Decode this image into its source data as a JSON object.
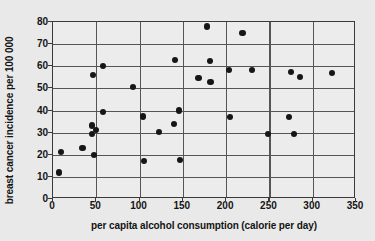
{
  "chart_data": {
    "type": "scatter",
    "title": "",
    "xlabel": "per capita alcohol consumption (calorie per day)",
    "ylabel": "breast cancer incidence per 100 000",
    "xlim": [
      0,
      350
    ],
    "ylim": [
      0,
      80
    ],
    "xticks": [
      0,
      50,
      100,
      150,
      200,
      250,
      300,
      350
    ],
    "yticks": [
      0,
      10,
      20,
      30,
      40,
      50,
      60,
      70,
      80
    ],
    "grid": true,
    "legend": null,
    "marker": "filled-circle",
    "marker_color": "#161616",
    "background_color": "#e9e9e9",
    "plot_background_color": "#ececec",
    "points": [
      {
        "x": 7,
        "y": 12.0
      },
      {
        "x": 9,
        "y": 21.3
      },
      {
        "x": 34,
        "y": 23.2
      },
      {
        "x": 45,
        "y": 33.2
      },
      {
        "x": 45,
        "y": 29.2
      },
      {
        "x": 46,
        "y": 56.0
      },
      {
        "x": 47,
        "y": 20.0
      },
      {
        "x": 50,
        "y": 31.1
      },
      {
        "x": 58,
        "y": 60.0
      },
      {
        "x": 58,
        "y": 39.4
      },
      {
        "x": 92,
        "y": 50.5
      },
      {
        "x": 104,
        "y": 37.3
      },
      {
        "x": 105,
        "y": 17.0
      },
      {
        "x": 122,
        "y": 30.1
      },
      {
        "x": 140,
        "y": 34.0
      },
      {
        "x": 141,
        "y": 63.0
      },
      {
        "x": 146,
        "y": 40.0
      },
      {
        "x": 147,
        "y": 17.8
      },
      {
        "x": 168,
        "y": 54.8
      },
      {
        "x": 178,
        "y": 78.0
      },
      {
        "x": 181,
        "y": 62.3
      },
      {
        "x": 182,
        "y": 52.7
      },
      {
        "x": 203,
        "y": 58.2
      },
      {
        "x": 204,
        "y": 37.1
      },
      {
        "x": 219,
        "y": 75.2
      },
      {
        "x": 230,
        "y": 58.4
      },
      {
        "x": 248,
        "y": 29.3
      },
      {
        "x": 273,
        "y": 36.9
      },
      {
        "x": 275,
        "y": 57.5
      },
      {
        "x": 278,
        "y": 29.4
      },
      {
        "x": 285,
        "y": 55.3
      },
      {
        "x": 322,
        "y": 57.1
      }
    ]
  },
  "axes": {
    "x_tick_labels": [
      "0",
      "50",
      "100",
      "150",
      "200",
      "250",
      "300",
      "350"
    ],
    "y_tick_labels": [
      "0",
      "10",
      "20",
      "30",
      "40",
      "50",
      "60",
      "70",
      "80"
    ],
    "x_title": "per capita alcohol consumption (calorie per day)",
    "y_title": "breast cancer incidence per 100 000"
  }
}
